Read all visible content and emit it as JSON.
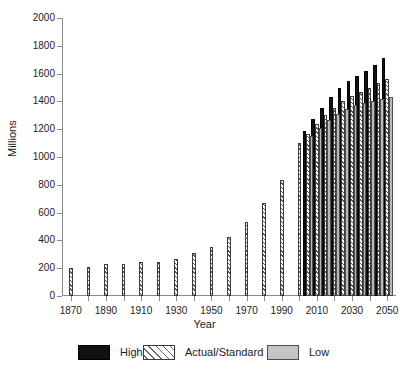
{
  "chart_data": {
    "type": "bar",
    "title": "",
    "xlabel": "Year",
    "ylabel": "Millions",
    "ylim": [
      0,
      2000
    ],
    "xlim": [
      1865,
      2055
    ],
    "ytick_values": [
      0,
      200,
      400,
      600,
      800,
      1000,
      1200,
      1400,
      1600,
      1800,
      2000
    ],
    "ytick_labels": [
      "0",
      "200",
      "400",
      "600",
      "800",
      "1000",
      "1200",
      "1400",
      "1600",
      "1800",
      "2000"
    ],
    "xtick_values": [
      1870,
      1880,
      1890,
      1900,
      1910,
      1920,
      1930,
      1940,
      1950,
      1960,
      1970,
      1980,
      1990,
      2000,
      2010,
      2020,
      2030,
      2040,
      2050
    ],
    "xtick_labeled": [
      1870,
      1890,
      1910,
      1930,
      1950,
      1970,
      1990,
      2010,
      2030,
      2050
    ],
    "xtick_labels": [
      "1870",
      "1890",
      "1910",
      "1930",
      "1950",
      "1970",
      "1990",
      "2010",
      "2030",
      "2050"
    ],
    "grid": false,
    "legend_position": "bottom",
    "series": [
      {
        "name": "High",
        "color": "#111111",
        "pattern": "solid",
        "points": [
          {
            "x": 2005,
            "y": 1190
          },
          {
            "x": 2010,
            "y": 1270
          },
          {
            "x": 2015,
            "y": 1355
          },
          {
            "x": 2020,
            "y": 1430
          },
          {
            "x": 2025,
            "y": 1495
          },
          {
            "x": 2030,
            "y": 1545
          },
          {
            "x": 2035,
            "y": 1580
          },
          {
            "x": 2040,
            "y": 1620
          },
          {
            "x": 2045,
            "y": 1665
          },
          {
            "x": 2050,
            "y": 1710
          }
        ]
      },
      {
        "name": "Actual/Standard",
        "color": "#cfcfcf",
        "pattern": "diagonal-hatch",
        "points": [
          {
            "x": 1870,
            "y": 205
          },
          {
            "x": 1880,
            "y": 207
          },
          {
            "x": 1890,
            "y": 228
          },
          {
            "x": 1900,
            "y": 228
          },
          {
            "x": 1910,
            "y": 247
          },
          {
            "x": 1920,
            "y": 243
          },
          {
            "x": 1930,
            "y": 268
          },
          {
            "x": 1940,
            "y": 310
          },
          {
            "x": 1950,
            "y": 352
          },
          {
            "x": 1960,
            "y": 428
          },
          {
            "x": 1970,
            "y": 535
          },
          {
            "x": 1980,
            "y": 668
          },
          {
            "x": 1990,
            "y": 835
          },
          {
            "x": 2000,
            "y": 1100
          },
          {
            "x": 2005,
            "y": 1165
          },
          {
            "x": 2010,
            "y": 1235
          },
          {
            "x": 2015,
            "y": 1300
          },
          {
            "x": 2020,
            "y": 1355
          },
          {
            "x": 2025,
            "y": 1400
          },
          {
            "x": 2030,
            "y": 1440
          },
          {
            "x": 2035,
            "y": 1470
          },
          {
            "x": 2040,
            "y": 1500
          },
          {
            "x": 2045,
            "y": 1530
          },
          {
            "x": 2050,
            "y": 1560
          }
        ]
      },
      {
        "name": "Low",
        "color": "#b8b8b8",
        "pattern": "solid-light",
        "points": [
          {
            "x": 2005,
            "y": 1150
          },
          {
            "x": 2010,
            "y": 1210
          },
          {
            "x": 2015,
            "y": 1265
          },
          {
            "x": 2020,
            "y": 1310
          },
          {
            "x": 2025,
            "y": 1345
          },
          {
            "x": 2030,
            "y": 1375
          },
          {
            "x": 2035,
            "y": 1390
          },
          {
            "x": 2040,
            "y": 1405
          },
          {
            "x": 2045,
            "y": 1420
          },
          {
            "x": 2050,
            "y": 1430
          }
        ]
      }
    ]
  },
  "legend": {
    "items": [
      {
        "label": "High",
        "key": "high"
      },
      {
        "label": "Actual/Standard",
        "key": "std"
      },
      {
        "label": "Low",
        "key": "low"
      }
    ]
  }
}
